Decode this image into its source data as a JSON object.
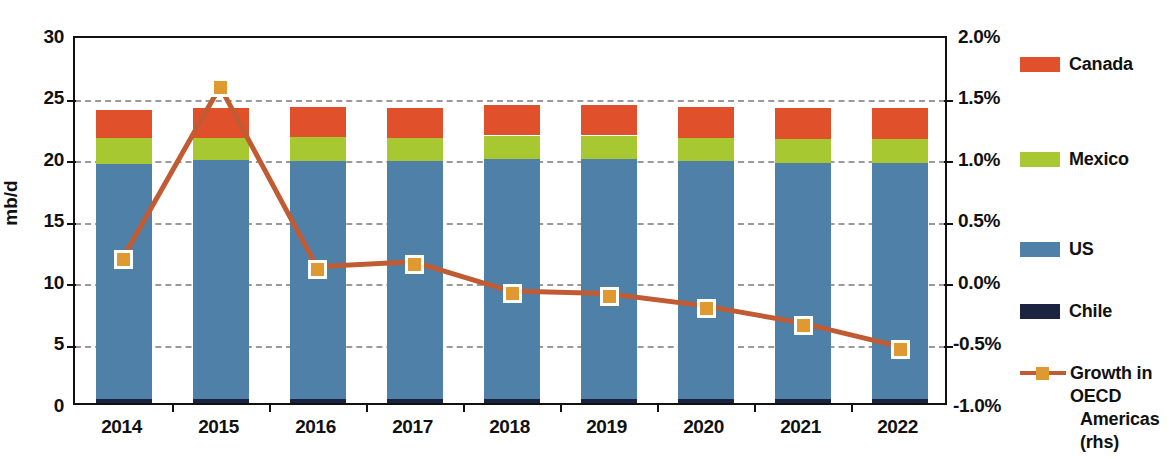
{
  "chart_data": {
    "type": "bar",
    "title": "",
    "xlabel": "",
    "ylabel": "mb/d",
    "ylabel_right": "",
    "categories": [
      "2014",
      "2015",
      "2016",
      "2017",
      "2018",
      "2019",
      "2020",
      "2021",
      "2022"
    ],
    "ylim": [
      0,
      30
    ],
    "yticks": [
      "0",
      "5",
      "10",
      "15",
      "20",
      "25",
      "30"
    ],
    "ylim_right": [
      -1.0,
      2.0
    ],
    "yticks_right": [
      "-1.0%",
      "-0.5%",
      "0.0%",
      "0.5%",
      "1.0%",
      "1.5%",
      "2.0%"
    ],
    "grid": true,
    "stacked": true,
    "legend_position": "right",
    "series": [
      {
        "name": "Chile",
        "color": "#1A2440",
        "values": [
          0.35,
          0.35,
          0.35,
          0.35,
          0.35,
          0.35,
          0.35,
          0.35,
          0.35
        ]
      },
      {
        "name": "US",
        "color": "#4F81A8",
        "values": [
          19.1,
          19.4,
          19.3,
          19.3,
          19.5,
          19.5,
          19.3,
          19.2,
          19.2
        ]
      },
      {
        "name": "Mexico",
        "color": "#A8C832",
        "values": [
          2.1,
          1.8,
          2.0,
          1.9,
          1.9,
          1.9,
          1.9,
          1.9,
          1.9
        ]
      },
      {
        "name": "Canada",
        "color": "#E0502A",
        "values": [
          2.3,
          2.4,
          2.4,
          2.4,
          2.5,
          2.5,
          2.5,
          2.5,
          2.5
        ]
      }
    ],
    "totals": [
      23.85,
      23.95,
      24.05,
      23.95,
      24.25,
      24.25,
      24.05,
      23.95,
      23.95
    ],
    "line_series": {
      "name": "Growth in OECD Americas (rhs)",
      "color": "#C05B33",
      "marker_color": "#E09830",
      "axis": "right",
      "unit": "%",
      "values": [
        0.2,
        1.6,
        0.12,
        0.16,
        -0.08,
        -0.1,
        -0.2,
        -0.34,
        -0.53
      ]
    }
  },
  "axes": {
    "left_title": "mb/d",
    "left_ticks": [
      "30",
      "25",
      "20",
      "15",
      "10",
      "5",
      "0"
    ],
    "right_ticks": [
      "2.0%",
      "1.5%",
      "1.0%",
      "0.5%",
      "0.0%",
      "-0.5%",
      "-1.0%"
    ],
    "x_ticks": [
      "2014",
      "2015",
      "2016",
      "2017",
      "2018",
      "2019",
      "2020",
      "2021",
      "2022"
    ]
  },
  "legend": {
    "items": [
      {
        "label": "Canada",
        "color": "#E0502A"
      },
      {
        "label": "Mexico",
        "color": "#A8C832"
      },
      {
        "label": "US",
        "color": "#4F81A8"
      },
      {
        "label": "Chile",
        "color": "#1A2440"
      }
    ],
    "line_item": {
      "label_line1": "Growth in OECD",
      "label_line2": "Americas (rhs)",
      "color": "#C05B33",
      "marker_color": "#E09830"
    }
  }
}
